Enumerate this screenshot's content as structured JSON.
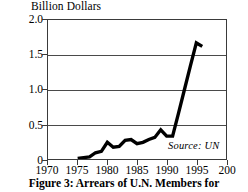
{
  "figure": {
    "caption": "Figure 3: Arrears of U.N. Members for",
    "source_note": "Source: UN"
  },
  "chart_data": {
    "type": "line",
    "title": "",
    "ylabel": "Billion Dollars",
    "xlabel": "",
    "xlim": [
      1970,
      2000
    ],
    "ylim": [
      0,
      2.0
    ],
    "grid": true,
    "legend": null,
    "xticks": [
      1970,
      1975,
      1980,
      1985,
      1990,
      1995,
      2000
    ],
    "xtick_labels": [
      "1970",
      "1975",
      "1980",
      "1985",
      "1990",
      "1995",
      "200"
    ],
    "yticks": [
      0,
      0.5,
      1.0,
      1.5,
      2.0
    ],
    "ytick_labels": [
      "0",
      "0.5",
      "1.0",
      "1.5",
      "2.0"
    ],
    "gridline_values": [
      0.5,
      1.0,
      1.5
    ],
    "series": [
      {
        "name": "Arrears of U.N. Members",
        "color": "#000000",
        "x": [
          1975,
          1976,
          1977,
          1978,
          1979,
          1980,
          1981,
          1982,
          1983,
          1984,
          1985,
          1986,
          1987,
          1988,
          1989,
          1990,
          1991,
          1992,
          1993,
          1994,
          1995,
          1996
        ],
        "values": [
          0.01,
          0.02,
          0.03,
          0.09,
          0.11,
          0.24,
          0.17,
          0.18,
          0.27,
          0.28,
          0.22,
          0.24,
          0.28,
          0.31,
          0.42,
          0.33,
          0.33,
          0.66,
          1.0,
          1.34,
          1.67,
          1.62
        ]
      }
    ],
    "annotations": [
      {
        "text": "Source: UN",
        "x": 1993.5,
        "y": 0.12,
        "style": "italic"
      }
    ]
  }
}
